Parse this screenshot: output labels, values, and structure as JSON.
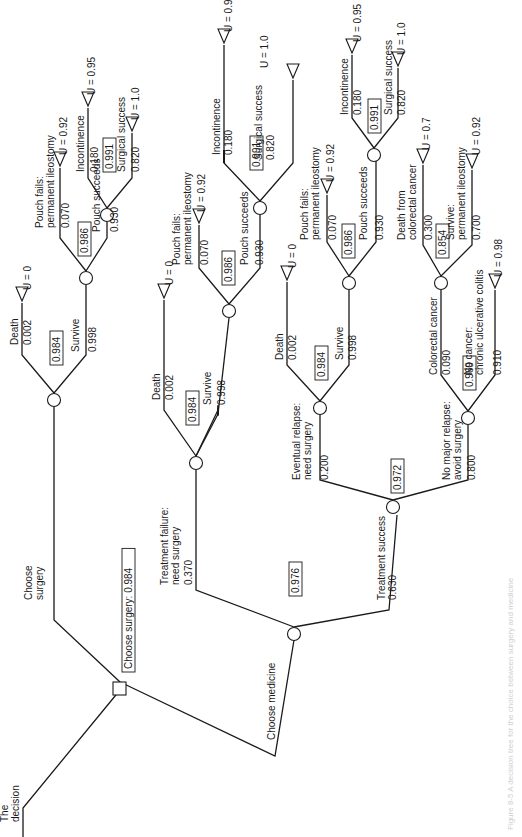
{
  "root": {
    "label": "The decision",
    "best_choice_label": "Choose surgery: 0.984",
    "choices": [
      {
        "id": "surgery",
        "label": [
          "Choose",
          "surgery"
        ],
        "ev": "0.984",
        "outcomes": [
          {
            "id": "s_death",
            "label": [
              "Death"
            ],
            "p": "0.002",
            "utility": "U = 0"
          },
          {
            "id": "s_survive",
            "label": [
              "Survive"
            ],
            "p": "0.998",
            "ev": "0.986",
            "outcomes": [
              {
                "id": "s_pfail",
                "label": [
                  "Pouch fails:",
                  "permanent ileostomy"
                ],
                "p": "0.070",
                "utility": "U = 0.92"
              },
              {
                "id": "s_psucc",
                "label": [
                  "Pouch succeeds"
                ],
                "p": "0.930",
                "ev": "0.991",
                "outcomes": [
                  {
                    "id": "s_inc",
                    "label": [
                      "Incontinence"
                    ],
                    "p": "0.180",
                    "utility": "U = 0.95"
                  },
                  {
                    "id": "s_ss",
                    "label": [
                      "Surgical success"
                    ],
                    "p": "0.820",
                    "utility": "U = 1.0"
                  }
                ]
              }
            ]
          }
        ]
      },
      {
        "id": "medicine",
        "label": [
          "Choose medicine"
        ],
        "ev": "0.976",
        "outcomes": [
          {
            "id": "m_tf",
            "label": [
              "Treatment failure:",
              "need surgery"
            ],
            "p": "0.370",
            "ev": "0.984",
            "outcomes": [
              {
                "id": "m_tf_death",
                "label": [
                  "Death"
                ],
                "p": "0.002",
                "utility": "U = 0"
              },
              {
                "id": "m_tf_survive",
                "label": [
                  "Survive"
                ],
                "p": "0.998",
                "ev": "0.986",
                "outcomes": [
                  {
                    "id": "m_tf_pfail",
                    "label": [
                      "Pouch fails:",
                      "permanent ileostomy"
                    ],
                    "p": "0.070",
                    "utility": "U = 0.92"
                  },
                  {
                    "id": "m_tf_psucc",
                    "label": [
                      "Pouch succeeds"
                    ],
                    "p": "0.930",
                    "ev": "0.991",
                    "outcomes": [
                      {
                        "id": "m_tf_inc",
                        "label": [
                          "Incontinence"
                        ],
                        "p": "0.180",
                        "utility": "U = 0.95"
                      },
                      {
                        "id": "m_tf_ss",
                        "label": [
                          "Surgical success"
                        ],
                        "p": "0.820",
                        "utility": "U = 1.0"
                      }
                    ]
                  }
                ]
              }
            ]
          },
          {
            "id": "m_ts",
            "label": [
              "Treatment success"
            ],
            "p": "0.630",
            "ev": "0.972",
            "outcomes": [
              {
                "id": "m_rel",
                "label": [
                  "Eventual relapse:",
                  "need surgery"
                ],
                "p": "0.200",
                "ev": "0.984",
                "outcomes": [
                  {
                    "id": "m_rel_death",
                    "label": [
                      "Death"
                    ],
                    "p": "0.002",
                    "utility": "U = 0"
                  },
                  {
                    "id": "m_rel_survive",
                    "label": [
                      "Survive"
                    ],
                    "p": "0.998",
                    "ev": "0.986",
                    "outcomes": [
                      {
                        "id": "m_rel_pfail",
                        "label": [
                          "Pouch fails:",
                          "permanent ileostomy"
                        ],
                        "p": "0.070",
                        "utility": "U = 0.92"
                      },
                      {
                        "id": "m_rel_psucc",
                        "label": [
                          "Pouch succeeds"
                        ],
                        "p": "0.930",
                        "ev": "0.991",
                        "outcomes": [
                          {
                            "id": "m_rel_inc",
                            "label": [
                              "Incontinence"
                            ],
                            "p": "0.180",
                            "utility": "U = 0.95"
                          },
                          {
                            "id": "m_rel_ss",
                            "label": [
                              "Surgical success"
                            ],
                            "p": "0.820",
                            "utility": "U = 1.0"
                          }
                        ]
                      }
                    ]
                  }
                ]
              },
              {
                "id": "m_norel",
                "label": [
                  "No major relapse:",
                  "avoid surgery"
                ],
                "p": "0.800",
                "ev": "0.969",
                "outcomes": [
                  {
                    "id": "m_cc",
                    "label": [
                      "Colorectal cancer"
                    ],
                    "p": "0.090",
                    "ev": "0.854",
                    "outcomes": [
                      {
                        "id": "m_cc_death",
                        "label": [
                          "Death from",
                          "colorectal cancer"
                        ],
                        "p": "0.300",
                        "utility": "U = 0.7"
                      },
                      {
                        "id": "m_cc_survive",
                        "label": [
                          "Survive:",
                          "permanent ileostomy"
                        ],
                        "p": "0.700",
                        "utility": "U = 0.92"
                      }
                    ]
                  },
                  {
                    "id": "m_nocancer",
                    "label": [
                      "No cancer:",
                      "chronic ulcerative colitis"
                    ],
                    "p": "0.910",
                    "utility": "U = 0.98"
                  }
                ]
              }
            ]
          }
        ]
      }
    ]
  },
  "caption": "Figure 8-5  A decision tree for the choice between surgery and medicine"
}
